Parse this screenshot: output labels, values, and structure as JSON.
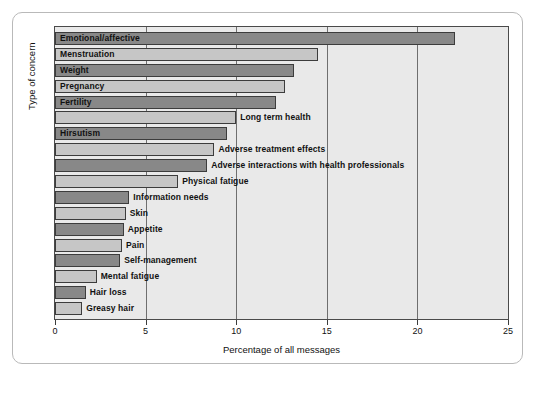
{
  "chart_data": {
    "type": "bar",
    "orientation": "horizontal",
    "title": "",
    "xlabel": "Percentage of all messages",
    "ylabel": "Type of concern",
    "xlim": [
      0,
      25
    ],
    "xticks": [
      0,
      5,
      10,
      15,
      20,
      25
    ],
    "xtick_labels": [
      "0",
      "5",
      "10",
      "15",
      "20",
      "25"
    ],
    "grid": true,
    "grid_axis": "x",
    "legend": "none",
    "categories": [
      "Emotional/affective",
      "Menstruation",
      "Weight",
      "Pregnancy",
      "Fertility",
      "Long term health",
      "Hirsutism",
      "Adverse treatment effects",
      "Adverse interactions with health professionals",
      "Physical fatigue",
      "Information needs",
      "Skin",
      "Appetite",
      "Pain",
      "Self-management",
      "Mental fatigue",
      "Hair loss",
      "Greasy hair"
    ],
    "values": [
      22.1,
      14.5,
      13.2,
      12.7,
      12.2,
      10.0,
      9.5,
      8.8,
      8.4,
      6.8,
      4.1,
      3.9,
      3.8,
      3.7,
      3.6,
      2.3,
      1.7,
      1.5
    ],
    "colors": {
      "dark_bar": "#888888",
      "light_bar": "#c6c6c6",
      "plot_background": "#e9e9e9",
      "bar_outline": "#3c3c3c",
      "gridline": "#6f6f6f",
      "frame_border": "#b9b9b9"
    },
    "bars": [
      {
        "label": "Emotional/affective",
        "value": 22.1,
        "shade": "dark",
        "label_inside": true
      },
      {
        "label": "Menstruation",
        "value": 14.5,
        "shade": "light",
        "label_inside": true
      },
      {
        "label": "Weight",
        "value": 13.2,
        "shade": "dark",
        "label_inside": true
      },
      {
        "label": "Pregnancy",
        "value": 12.7,
        "shade": "light",
        "label_inside": true
      },
      {
        "label": "Fertility",
        "value": 12.2,
        "shade": "dark",
        "label_inside": true
      },
      {
        "label": "Long term health",
        "value": 10.0,
        "shade": "light",
        "label_inside": false
      },
      {
        "label": "Hirsutism",
        "value": 9.5,
        "shade": "dark",
        "label_inside": true
      },
      {
        "label": "Adverse treatment effects",
        "value": 8.8,
        "shade": "light",
        "label_inside": false
      },
      {
        "label": "Adverse interactions with health professionals",
        "value": 8.4,
        "shade": "dark",
        "label_inside": false
      },
      {
        "label": "Physical fatigue",
        "value": 6.8,
        "shade": "light",
        "label_inside": false
      },
      {
        "label": "Information needs",
        "value": 4.1,
        "shade": "dark",
        "label_inside": false
      },
      {
        "label": "Skin",
        "value": 3.9,
        "shade": "light",
        "label_inside": false
      },
      {
        "label": "Appetite",
        "value": 3.8,
        "shade": "dark",
        "label_inside": false
      },
      {
        "label": "Pain",
        "value": 3.7,
        "shade": "light",
        "label_inside": false
      },
      {
        "label": "Self-management",
        "value": 3.6,
        "shade": "dark",
        "label_inside": false
      },
      {
        "label": "Mental fatigue",
        "value": 2.3,
        "shade": "light",
        "label_inside": false
      },
      {
        "label": "Hair loss",
        "value": 1.7,
        "shade": "dark",
        "label_inside": false
      },
      {
        "label": "Greasy hair",
        "value": 1.5,
        "shade": "light",
        "label_inside": false
      }
    ]
  }
}
